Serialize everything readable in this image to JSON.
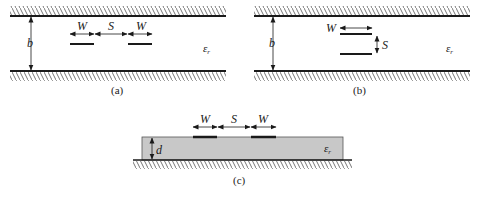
{
  "figure": {
    "colors": {
      "line": "#1a1a1a",
      "hatch": "#555555",
      "substrate": "#c8c8c8",
      "substrate_border": "#555555"
    },
    "panels": [
      {
        "id": "a",
        "caption": "(a)",
        "type": "coupled stripline, edge-coupled",
        "labels": {
          "width_left": "W",
          "spacing": "S",
          "width_right": "W",
          "height": "b",
          "permittivity": "ε",
          "permittivity_sub": "r"
        }
      },
      {
        "id": "b",
        "caption": "(b)",
        "type": "coupled stripline, broadside-coupled",
        "labels": {
          "width": "W",
          "spacing": "S",
          "height": "b",
          "permittivity": "ε",
          "permittivity_sub": "r"
        }
      },
      {
        "id": "c",
        "caption": "(c)",
        "type": "coupled microstrip",
        "labels": {
          "width_left": "W",
          "spacing": "S",
          "width_right": "W",
          "height": "d",
          "permittivity": "ε",
          "permittivity_sub": "r"
        }
      }
    ]
  }
}
